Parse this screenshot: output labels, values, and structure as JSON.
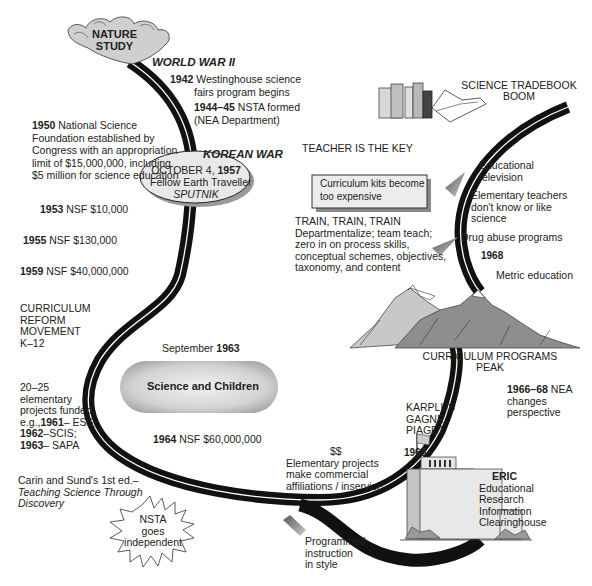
{
  "nature_study": {
    "line1": "NATURE",
    "line2": "STUDY"
  },
  "world_war": "WORLD WAR II",
  "e1942": {
    "year": "1942",
    "line1": "Westinghouse science",
    "line2": "fairs program begins"
  },
  "e1944": {
    "year": "1944–45",
    "text": "NSTA formed",
    "line2": "(NEA Department)"
  },
  "e1950": {
    "year": "1950",
    "line1": "National Science",
    "line2": "Foundation established by",
    "line3": "Congress with an appropriation",
    "line4": "limit of $15,000,000, including",
    "line5": "$5 million for science education"
  },
  "korean_war": "KOREAN WAR",
  "e1953": {
    "year": "1953",
    "text": "NSF $10,000"
  },
  "e1955": {
    "year": "1955",
    "text": "NSF $130,000"
  },
  "e1959": {
    "year": "1959",
    "text": "NSF $40,000,000"
  },
  "sputnik": {
    "date": "OCTOBER 4,",
    "year": "1957",
    "line2": "Fellow Earth Traveller",
    "line3": "SPUTNIK"
  },
  "reform": {
    "line1": "CURRICULUM",
    "line2": "REFORM",
    "line3": "MOVEMENT",
    "line4": "K–12"
  },
  "sept1963": {
    "month": "September",
    "year": "1963"
  },
  "science_children": "Science and Children",
  "projects": {
    "line1": "20–25",
    "line2": "elementary",
    "line3": "projects funded,",
    "line4a": "e.g.,",
    "y1961": "1961",
    "t1961": "– ESS;",
    "y1962": "1962",
    "t1962": "–SCIS;",
    "y1963": "1963",
    "t1963": "– SAPA"
  },
  "e1964": {
    "year": "1964",
    "text": "NSF $60,000,000"
  },
  "carin": {
    "line1": "Carin and Sund's 1st ed.–",
    "line2": "Teaching Science Through",
    "line3": "Discovery"
  },
  "nsta_independent": {
    "line1": "NSTA",
    "line2": "goes",
    "line3": "independent"
  },
  "tradebook": {
    "line1": "SCIENCE TRADEBOOK",
    "line2": "BOOM"
  },
  "teacher_key": {
    "heading": "TEACHER IS THE KEY",
    "box1": "Curriculum kits become",
    "box2": "too expensive"
  },
  "train": {
    "heading": "TRAIN, TRAIN, TRAIN",
    "line1": "Departmentalize; team teach;",
    "line2": "zero in on process skills,",
    "line3": "conceptual schemes, objectives,",
    "line4": "taxonomy, and content"
  },
  "right_items": {
    "edtv1": "Educational",
    "edtv2": "television",
    "elem1": "Elementary teachers",
    "elem2": "don't know or like",
    "elem3": "science",
    "drug": "Drug abuse programs",
    "y1968": "1968",
    "metric": "Metric education"
  },
  "peak": {
    "line1": "CURRICULUM PROGRAMS",
    "line2": "PEAK"
  },
  "nea": {
    "year": "1966–68",
    "text": "NEA",
    "line2": "changes",
    "line3": "perspective"
  },
  "theorists": {
    "line1": "KARPLUS",
    "line2": "GAGNE",
    "line3": "PIAGET"
  },
  "y1968b": "1968",
  "commercial": {
    "money": "$$",
    "line1": "Elementary projects",
    "line2": "make commercial",
    "line3": "affiliations / inservice"
  },
  "programmed": {
    "line1": "Programmed",
    "line2": "instruction",
    "line3": "in style"
  },
  "eric": {
    "name": "ERIC",
    "line1": "Educational",
    "line2": "Research",
    "line3": "Information",
    "line4": "Clearinghouse"
  },
  "colors": {
    "road": "#111111",
    "road_stripe": "#ffffff",
    "gray_fill": "#d0d0d0",
    "mountain_light": "#c8c8c8",
    "mountain_dark": "#8a8a8a"
  }
}
